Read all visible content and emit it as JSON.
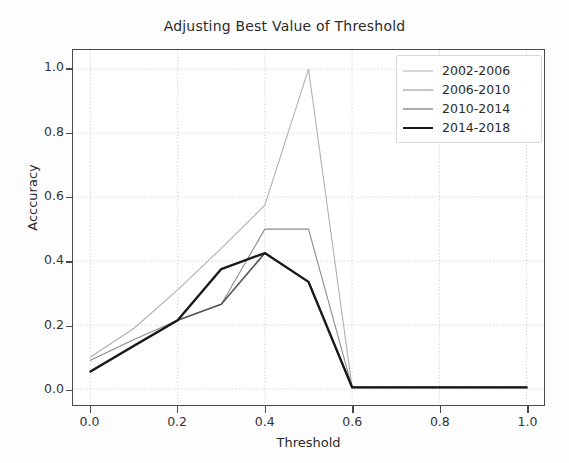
{
  "chart_data": {
    "type": "line",
    "title": "Adjusting Best Value of Threshold",
    "xlabel": "Threshold",
    "ylabel": "Acccuracy",
    "xlim": [
      -0.04,
      1.04
    ],
    "ylim": [
      -0.05,
      1.06
    ],
    "xticks": [
      "0.0",
      "0.2",
      "0.4",
      "0.6",
      "0.8",
      "1.0"
    ],
    "xtick_values": [
      0.0,
      0.2,
      0.4,
      0.6,
      0.8,
      1.0
    ],
    "yticks": [
      "0.0",
      "0.2",
      "0.4",
      "0.6",
      "0.8",
      "1.0"
    ],
    "ytick_values": [
      0.0,
      0.2,
      0.4,
      0.6,
      0.8,
      1.0
    ],
    "grid": true,
    "grid_style": "dotted",
    "grid_color": "#c8c8c8",
    "legend_position": "upper right",
    "x": [
      0.0,
      0.1,
      0.2,
      0.3,
      0.4,
      0.5,
      0.6,
      0.8,
      1.0
    ],
    "series": [
      {
        "name": "2002-2006",
        "color": "#b0b0b0",
        "width": 1.1,
        "values": [
          0.1,
          0.19,
          0.31,
          0.44,
          0.575,
          1.0,
          0.005,
          0.005,
          0.005
        ]
      },
      {
        "name": "2006-2010",
        "color": "#8c8c8c",
        "width": 1.1,
        "values": [
          0.09,
          0.155,
          0.215,
          0.265,
          0.5,
          0.5,
          0.005,
          0.005,
          0.005
        ]
      },
      {
        "name": "2010-2014",
        "color": "#595959",
        "width": 1.7,
        "values": [
          0.055,
          0.135,
          0.215,
          0.265,
          0.425,
          0.335,
          0.005,
          0.005,
          0.005
        ]
      },
      {
        "name": "2014-2018",
        "color": "#1a1a1a",
        "width": 2.4,
        "values": [
          0.055,
          0.135,
          0.215,
          0.375,
          0.425,
          0.335,
          0.005,
          0.005,
          0.005
        ]
      }
    ]
  }
}
